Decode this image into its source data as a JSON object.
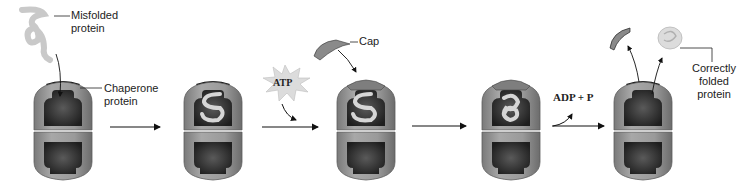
{
  "labels": {
    "misfolded": "Misfolded\nprotein",
    "misfolded_line1": "Misfolded",
    "misfolded_line2": "protein",
    "chaperone_line1": "Chaperone",
    "chaperone_line2": "protein",
    "cap": "Cap",
    "atp": "ATP",
    "adp": "ADP + P",
    "correct_line1": "Correctly",
    "correct_line2": "folded",
    "correct_line3": "protein"
  },
  "stages": [
    {
      "id": 1,
      "x": 30,
      "content": "empty-open"
    },
    {
      "id": 2,
      "x": 175,
      "content": "unfolded-open"
    },
    {
      "id": 3,
      "x": 333,
      "content": "unfolded-capped"
    },
    {
      "id": 4,
      "x": 480,
      "content": "folded-capped"
    },
    {
      "id": 5,
      "x": 612,
      "content": "empty-open"
    }
  ],
  "colors": {
    "shell": "#8f8f8f",
    "shell_light": "#b5b5b5",
    "cavity": "#3a3a3a",
    "text": "#222222",
    "protein": "#d8d8d8"
  }
}
